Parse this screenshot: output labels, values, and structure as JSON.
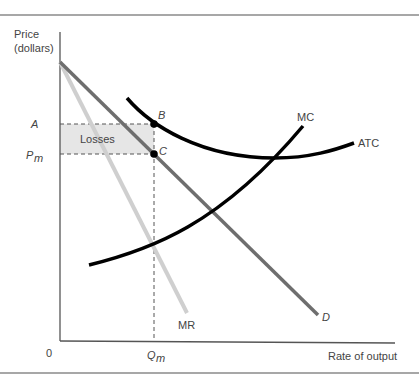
{
  "figure": {
    "type": "monopoly-losses-diagram",
    "y_axis_label_line1": "Price",
    "y_axis_label_line2": "(dollars)",
    "x_axis_label": "Rate of output",
    "origin_label": "0",
    "price_labels": {
      "a": "A",
      "pm_main": "P",
      "pm_sub": "m"
    },
    "quantity_label": {
      "main": "Q",
      "sub": "m"
    },
    "points": {
      "b": "B",
      "c": "C"
    },
    "region_label": "Losses",
    "curves": {
      "mc": "MC",
      "atc": "ATC",
      "mr": "MR",
      "d": "D"
    },
    "colors": {
      "frame_rule": "#8a8a8a",
      "axis": "#555555",
      "demand": "#6e6e6e",
      "marginal_revenue": "#cfcfcf",
      "cost_curves": "#000000",
      "losses_fill": "#e6e6e6",
      "dashed": "#555555",
      "text": "#444444"
    }
  }
}
